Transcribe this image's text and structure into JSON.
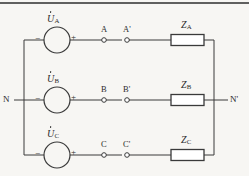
{
  "figure": {
    "kind": "three-phase-four-wire-circuit",
    "background_color": "#f7f6f3",
    "line_color": "#3a3a3a",
    "text_color": "#2b2b2b",
    "top_rule_color": "#2e2e2e"
  },
  "nodes": {
    "left_neutral": "N",
    "right_neutral": "N'"
  },
  "phases": [
    {
      "source_label": "U",
      "source_subscript": "A",
      "minus_sign": "−",
      "plus_sign": "+",
      "terminal_near": "A",
      "terminal_far": "A'",
      "impedance_label": "Z",
      "impedance_subscript": "A"
    },
    {
      "source_label": "U",
      "source_subscript": "B",
      "minus_sign": "−",
      "plus_sign": "+",
      "terminal_near": "B",
      "terminal_far": "B'",
      "impedance_label": "Z",
      "impedance_subscript": "B"
    },
    {
      "source_label": "U",
      "source_subscript": "C",
      "minus_sign": "−",
      "plus_sign": "+",
      "terminal_near": "C",
      "terminal_far": "C'",
      "impedance_label": "Z",
      "impedance_subscript": "C"
    }
  ]
}
